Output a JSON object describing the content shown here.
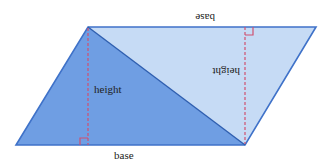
{
  "diagram": {
    "labels": {
      "bottom_base": "base",
      "top_base": "base",
      "left_height": "height",
      "right_height": "height"
    },
    "colors": {
      "dark_triangle": "#6f9ee3",
      "light_triangle": "#c6dbf5",
      "outline": "#3f72c9",
      "height_line": "#d05070",
      "text": "#222222"
    }
  }
}
